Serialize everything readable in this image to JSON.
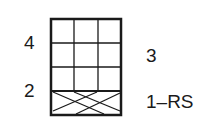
{
  "chart": {
    "type": "knitting-chart",
    "columns": 3,
    "rows": 4,
    "row_labels": {
      "row1": "1–RS",
      "row2": "2",
      "row3": "3",
      "row4": "4"
    },
    "cable_row": 1,
    "line_color": "#1a1a1a",
    "background": "#ffffff"
  }
}
